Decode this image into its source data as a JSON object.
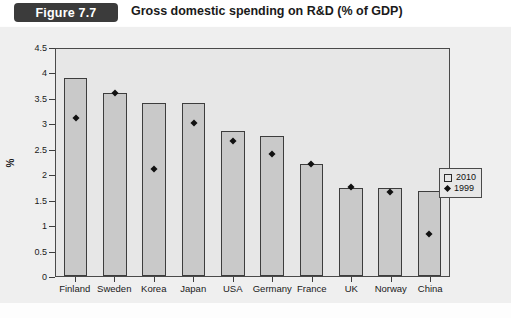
{
  "header": {
    "figure_badge": "Figure 7.7",
    "title": "Gross domestic spending on R&D (% of GDP)"
  },
  "legend": {
    "items": [
      {
        "label": "2010",
        "marker": "open-square"
      },
      {
        "label": "1999",
        "marker": "filled-diamond"
      }
    ]
  },
  "axes": {
    "ylabel": "%",
    "yticks": [
      "0",
      "0.5",
      "1",
      "1.5",
      "2",
      "2.5",
      "3",
      "3.5",
      "4",
      "4.5"
    ]
  },
  "chart_data": {
    "type": "bar",
    "title": "Gross domestic spending on R&D (% of GDP)",
    "xlabel": "",
    "ylabel": "%",
    "ylim": [
      0,
      4.5
    ],
    "ytick_step": 0.5,
    "grid": false,
    "legend_position": "right",
    "categories": [
      "Finland",
      "Sweden",
      "Korea",
      "Japan",
      "USA",
      "Germany",
      "France",
      "UK",
      "Norway",
      "China"
    ],
    "series": [
      {
        "name": "2010",
        "type": "bar",
        "values": [
          3.9,
          3.6,
          3.4,
          3.4,
          2.85,
          2.75,
          2.2,
          1.73,
          1.72,
          1.67
        ]
      },
      {
        "name": "1999",
        "type": "marker",
        "values": [
          3.1,
          3.6,
          2.1,
          3.0,
          2.65,
          2.4,
          2.2,
          1.75,
          1.65,
          0.83
        ]
      }
    ]
  },
  "colors": {
    "badge_background": "#3b3b3b",
    "badge_text": "#ffffff",
    "panel_background": "#efefef",
    "plot_background": "#e7e7e7",
    "bar_fill": "#c9c9c9",
    "bar_stroke": "#3d3d3d",
    "marker": "#111111"
  }
}
